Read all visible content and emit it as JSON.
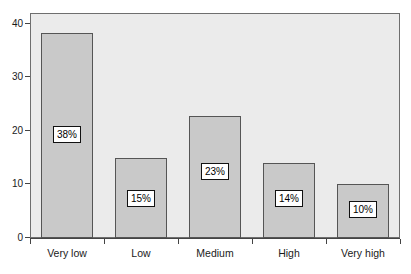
{
  "chart_data": {
    "type": "bar",
    "title": "",
    "subtitle": "",
    "xlabel": "",
    "ylabel": "",
    "categories": [
      "Very low",
      "Low",
      "Medium",
      "High",
      "Very high"
    ],
    "values": [
      38.2,
      14.9,
      22.7,
      14.0,
      10.1
    ],
    "data_labels": [
      "38%",
      "15%",
      "23%",
      "14%",
      "10%"
    ],
    "ylim": [
      0,
      42
    ],
    "yticks": [
      0,
      10,
      20,
      30,
      40
    ],
    "ytick_labels": [
      "0",
      "10",
      "20",
      "30",
      "40"
    ],
    "grid": false,
    "legend": false,
    "legend_position": "none",
    "bar_fill_color": "#c9c9c9",
    "bar_edge_color": "#555555",
    "panel_background": "#ebebeb",
    "panel_border_color": "#6e6e6e",
    "axis_color": "#444444",
    "text_color": "#1a1a1a",
    "label_box_background": "#ffffff",
    "label_box_border": "#111111",
    "label_y_values": [
      19.5,
      7.5,
      12.5,
      7.5,
      5.5
    ]
  }
}
